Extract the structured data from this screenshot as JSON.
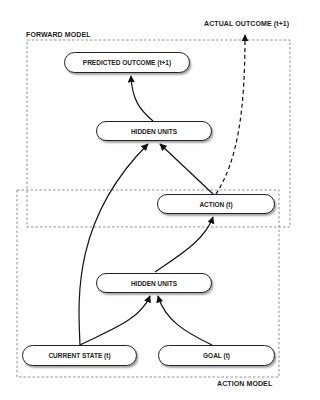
{
  "diagram": {
    "groups": {
      "forward_model": "FORWARD MODEL",
      "action_model": "ACTION MODEL"
    },
    "external": {
      "actual_outcome": "ACTUAL OUTCOME (t+1)"
    },
    "nodes": {
      "predicted_outcome": "PREDICTED OUTCOME (t+1)",
      "hidden_units_forward": "HIDDEN UNITS",
      "action": "ACTION (t)",
      "hidden_units_action": "HIDDEN UNITS",
      "current_state": "CURRENT STATE (t)",
      "goal": "GOAL (t)"
    },
    "edges": [
      {
        "from": "hidden_units_forward",
        "to": "predicted_outcome",
        "style": "solid"
      },
      {
        "from": "current_state",
        "to": "hidden_units_forward",
        "style": "solid"
      },
      {
        "from": "action",
        "to": "hidden_units_forward",
        "style": "solid"
      },
      {
        "from": "action",
        "to": "actual_outcome",
        "style": "dashed"
      },
      {
        "from": "hidden_units_action",
        "to": "action",
        "style": "solid"
      },
      {
        "from": "current_state",
        "to": "hidden_units_action",
        "style": "solid"
      },
      {
        "from": "goal",
        "to": "hidden_units_action",
        "style": "solid"
      }
    ]
  }
}
